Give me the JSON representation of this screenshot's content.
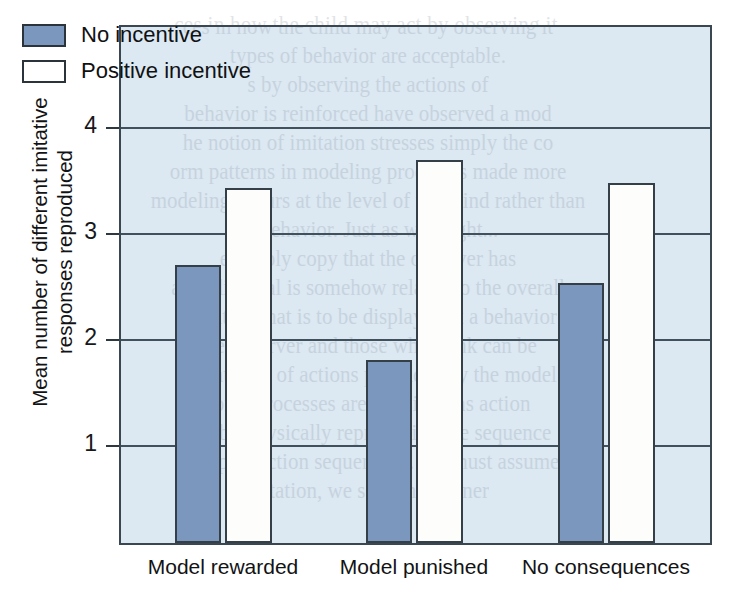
{
  "chart_data": {
    "type": "bar",
    "title": "",
    "subtitle": "",
    "xlabel": "",
    "ylabel": "Mean number of different imitative responses reproduced",
    "ylabel_line1": "Mean number of different imitative",
    "ylabel_line2": "responses reproduced",
    "categories": [
      "Model rewarded",
      "Model punished",
      "No consequences"
    ],
    "series": [
      {
        "name": "No incentive",
        "values": [
          2.7,
          1.8,
          2.53
        ],
        "color": "#7b97bd",
        "style": "filled"
      },
      {
        "name": "Positive incentive",
        "values": [
          3.42,
          3.69,
          3.47
        ],
        "color": "#ffffff",
        "style": "hollow"
      }
    ],
    "ylim": [
      0,
      4.55
    ],
    "yticks": [
      1,
      2,
      3,
      4
    ],
    "ytick_labels": [
      "1",
      "2",
      "3",
      "4"
    ],
    "grid": "horizontal",
    "legend_position": "top-left",
    "plot_background": "#dce8f2",
    "axis_color": "#3b4750",
    "bar_edge_color": "#353f47"
  },
  "legend": {
    "items": [
      {
        "label": "No incentive",
        "style": "filled"
      },
      {
        "label": "Positive incentive",
        "style": "hollow"
      }
    ]
  },
  "scan_bleed": {
    "note": "faint mirrored book text showing through the scanned page",
    "lines": [
      "ces in how the child may act by observing it",
      "types of behavior are acceptable.",
      "s by observing the actions of",
      "behavior is reinforced have observed a mod",
      "he notion of imitation stresses simply the co",
      "orm patterns in modeling processes made more",
      "modeling occurs at the level of the mind rather than",
      "of behavior. Just as we might...",
      "e simply copy that the observer has",
      "an individual is somehow related to the overall",
      "ormation that is to be displayed at a behavior",
      "the observer and those who think can be",
      "resentation of actions produced by the model",
      "some processes are classified as action",
      "ons by physically reproducing the sequence",
      "ch reproduction sequencing. We must assume",
      "mitation, we seen the learner"
    ]
  }
}
